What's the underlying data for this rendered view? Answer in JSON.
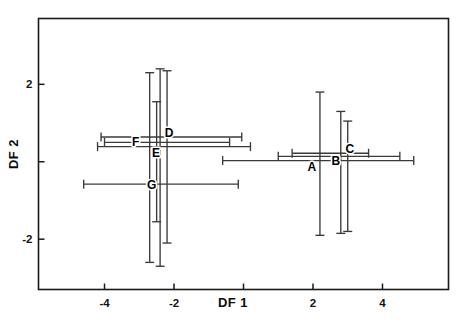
{
  "chart_data": {
    "type": "scatter",
    "title": "",
    "xlabel": "DF 1",
    "ylabel": "DF 2",
    "xlim": [
      -5.9,
      5.9
    ],
    "ylim": [
      -3.3,
      3.7
    ],
    "xticks": [
      -4,
      -2,
      0,
      2,
      4
    ],
    "xticklabels": [
      "-4",
      "-2",
      "",
      "2",
      "4"
    ],
    "yticks": [
      2,
      0,
      -2
    ],
    "yticklabels": [
      "2",
      "",
      "-2"
    ],
    "grid": false,
    "legend": "none",
    "error_bars": "both",
    "annotation_note": "Each group shown as a labelled centroid with horizontal (DF 1) and vertical (DF 2) error bars; tick marks point inward from the axis frame.",
    "points": [
      {
        "label": "A",
        "x": 2.2,
        "y": 0.03,
        "x_low": -0.6,
        "x_high": 4.9,
        "y_low": -1.9,
        "y_high": 1.8,
        "label_dx": -8,
        "label_dy": 10
      },
      {
        "label": "B",
        "x": 2.8,
        "y": 0.14,
        "x_low": 1.0,
        "x_high": 4.5,
        "y_low": -1.85,
        "y_high": 1.3,
        "label_dx": -5,
        "label_dy": 9
      },
      {
        "label": "C",
        "x": 3.0,
        "y": 0.22,
        "x_low": 1.4,
        "x_high": 3.6,
        "y_low": -1.8,
        "y_high": 1.05,
        "label_dx": 2,
        "label_dy": 0
      },
      {
        "label": "D",
        "x": -2.2,
        "y": 0.64,
        "x_low": -4.1,
        "x_high": -0.05,
        "y_low": -2.1,
        "y_high": 2.35,
        "label_dx": 2,
        "label_dy": 0
      },
      {
        "label": "E",
        "x": -2.4,
        "y": 0.39,
        "x_low": -4.2,
        "x_high": 0.2,
        "y_low": -2.7,
        "y_high": 2.4,
        "label_dx": -4,
        "label_dy": 10
      },
      {
        "label": "F",
        "x": -2.7,
        "y": 0.5,
        "x_low": -4.0,
        "x_high": -0.4,
        "y_low": -2.6,
        "y_high": 2.3,
        "label_dx": -14,
        "label_dy": 4
      },
      {
        "label": "G",
        "x": -2.5,
        "y": -0.58,
        "x_low": -4.6,
        "x_high": -0.15,
        "y_low": -1.55,
        "y_high": 1.55,
        "label_dx": -5,
        "label_dy": 5
      }
    ]
  },
  "axes": {
    "x_title": "DF 1",
    "y_title": "DF 2"
  }
}
